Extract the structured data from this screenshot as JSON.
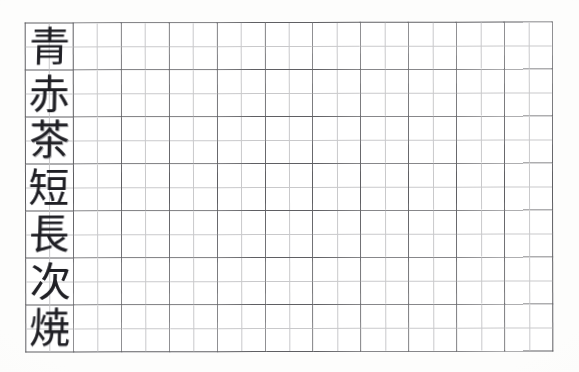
{
  "document": {
    "kind": "kanji-practice-worksheet",
    "title": "",
    "background_color": "#fdfdfc",
    "paper_color": "#ffffff"
  },
  "grid": {
    "major_columns": 11,
    "major_rows": 7,
    "subdivisions_per_cell_horizontal": 2,
    "subdivisions_per_cell_vertical": 2,
    "major_line_color": "#5f5f63",
    "sub_line_color": "#c9c9cb",
    "left_px": 25,
    "top_px": 22,
    "width_px": 528,
    "height_px": 328,
    "major_cell_width_px": 48,
    "major_cell_height_px": 47
  },
  "prompt_column": {
    "column_index": 0,
    "ink_color": "#25252a",
    "entries": [
      {
        "row": 1,
        "character": "青"
      },
      {
        "row": 2,
        "character": "赤"
      },
      {
        "row": 3,
        "character": "茶"
      },
      {
        "row": 4,
        "character": "短"
      },
      {
        "row": 5,
        "character": "長"
      },
      {
        "row": 6,
        "character": "次"
      },
      {
        "row": 7,
        "character": "焼"
      }
    ]
  },
  "practice_cells": {
    "per_row": 10,
    "total": 70,
    "content": ""
  }
}
